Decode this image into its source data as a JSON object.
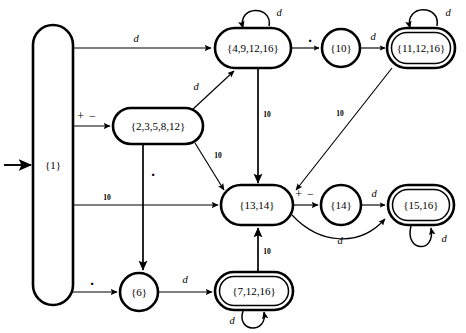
{
  "diagram": {
    "type": "finite-state-automaton",
    "title": "",
    "start_state": "{1}",
    "start_marker": "incoming-arrow",
    "states": [
      {
        "id": "s1",
        "label": "{1}",
        "shape": "tall-capsule",
        "accepting": false,
        "x": 53,
        "y": 165,
        "w": 40,
        "h": 280
      },
      {
        "id": "s4",
        "label": "{4,9,12,16}",
        "shape": "rounded-rect",
        "accepting": false,
        "x": 253,
        "y": 48,
        "w": 76,
        "h": 40
      },
      {
        "id": "s10",
        "label": "{10}",
        "shape": "circle",
        "accepting": false,
        "x": 341,
        "y": 48,
        "w": 38,
        "h": 38
      },
      {
        "id": "s11",
        "label": "{11,12,16}",
        "shape": "rounded-rect",
        "accepting": true,
        "x": 421,
        "y": 48,
        "w": 68,
        "h": 40
      },
      {
        "id": "s2",
        "label": "{2,3,5,8,12}",
        "shape": "rounded-rect",
        "accepting": false,
        "x": 158,
        "y": 126,
        "w": 90,
        "h": 36
      },
      {
        "id": "s13",
        "label": "{13,14}",
        "shape": "rounded-rect",
        "accepting": false,
        "x": 257,
        "y": 205,
        "w": 72,
        "h": 40
      },
      {
        "id": "s14",
        "label": "{14}",
        "shape": "circle",
        "accepting": false,
        "x": 341,
        "y": 205,
        "w": 40,
        "h": 40
      },
      {
        "id": "s15",
        "label": "{15,16}",
        "shape": "rounded-rect",
        "accepting": true,
        "x": 421,
        "y": 205,
        "w": 66,
        "h": 40
      },
      {
        "id": "s6",
        "label": "{6}",
        "shape": "circle",
        "accepting": false,
        "x": 139,
        "y": 292,
        "w": 38,
        "h": 38
      },
      {
        "id": "s7",
        "label": "{7,12,16}",
        "shape": "rounded-rect",
        "accepting": true,
        "x": 254,
        "y": 291,
        "w": 78,
        "h": 38
      }
    ],
    "transitions": [
      {
        "from": "s1",
        "to": "s4",
        "label": "d",
        "label_kind": "letter"
      },
      {
        "from": "s1",
        "to": "s2",
        "label": "+ −",
        "label_kind": "symbol"
      },
      {
        "from": "s1",
        "to": "s13",
        "label": "10",
        "label_kind": "number"
      },
      {
        "from": "s1",
        "to": "s6",
        "label": ".",
        "label_kind": "dot"
      },
      {
        "from": "s4",
        "to": "s4",
        "label": "d",
        "label_kind": "letter",
        "self_loop": true
      },
      {
        "from": "s4",
        "to": "s10",
        "label": ".",
        "label_kind": "dot"
      },
      {
        "from": "s4",
        "to": "s13",
        "label": "10",
        "label_kind": "number"
      },
      {
        "from": "s10",
        "to": "s11",
        "label": "d",
        "label_kind": "letter"
      },
      {
        "from": "s11",
        "to": "s11",
        "label": "d",
        "label_kind": "letter",
        "self_loop": true
      },
      {
        "from": "s11",
        "to": "s13",
        "label": "10",
        "label_kind": "number"
      },
      {
        "from": "s2",
        "to": "s4",
        "label": "d",
        "label_kind": "letter"
      },
      {
        "from": "s2",
        "to": "s13",
        "label": "10",
        "label_kind": "number"
      },
      {
        "from": "s2",
        "to": "s6",
        "label": ".",
        "label_kind": "dot"
      },
      {
        "from": "s13",
        "to": "s14",
        "label": "+ −",
        "label_kind": "symbol"
      },
      {
        "from": "s13",
        "to": "s15",
        "label": "d",
        "label_kind": "letter"
      },
      {
        "from": "s14",
        "to": "s15",
        "label": "d",
        "label_kind": "letter"
      },
      {
        "from": "s15",
        "to": "s15",
        "label": "d",
        "label_kind": "letter",
        "self_loop": true
      },
      {
        "from": "s6",
        "to": "s7",
        "label": "d",
        "label_kind": "letter"
      },
      {
        "from": "s7",
        "to": "s7",
        "label": "d",
        "label_kind": "letter",
        "self_loop": true
      },
      {
        "from": "s7",
        "to": "s13",
        "label": "10",
        "label_kind": "number"
      }
    ],
    "labels": {
      "d": "d",
      "plus_minus": "+ −",
      "ten": "10",
      "dot": "."
    },
    "colors": {
      "stroke": "#000000",
      "fill": "#ffffff",
      "background": "#ffffff"
    }
  }
}
